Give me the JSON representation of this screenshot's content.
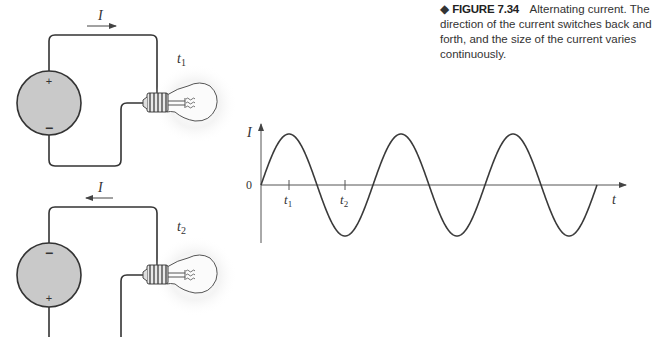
{
  "caption": {
    "marker": "◆",
    "figure_number": "FIGURE 7.34",
    "text": "Alternating current. The direction of the current switches back and forth, and the size of the current varies continuously."
  },
  "circuit1": {
    "current_label": "I",
    "current_direction": "right",
    "time_label": "t",
    "time_subscript": "1",
    "battery_top_sign": "+",
    "battery_bottom_sign": "−"
  },
  "circuit2": {
    "current_label": "I",
    "current_direction": "left",
    "time_label": "t",
    "time_subscript": "2",
    "battery_top_sign": "−",
    "battery_bottom_sign": "+"
  },
  "graph": {
    "y_axis_label": "I",
    "x_axis_label": "t",
    "origin_label": "0",
    "tick1_label": "t",
    "tick1_subscript": "1",
    "tick2_label": "t",
    "tick2_subscript": "2"
  },
  "chart_data": {
    "type": "line",
    "title": "",
    "xlabel": "t",
    "ylabel": "I",
    "x_ticks": [
      "t1",
      "t2"
    ],
    "x_tick_positions_fraction_of_period": [
      0.25,
      0.75
    ],
    "cycles": 3,
    "amplitude": 1,
    "series": [
      {
        "name": "I(t)",
        "function": "sin",
        "x": [
          0,
          0.25,
          0.5,
          0.75,
          1,
          1.25,
          1.5,
          1.75,
          2,
          2.25,
          2.5,
          2.75,
          3
        ],
        "values": [
          0,
          1,
          0,
          -1,
          0,
          1,
          0,
          -1,
          0,
          1,
          0,
          -1,
          0
        ]
      }
    ],
    "grid": false
  },
  "colors": {
    "line": "#3a3a3a",
    "battery_fill": "#c9c9c9",
    "text": "#333333"
  }
}
